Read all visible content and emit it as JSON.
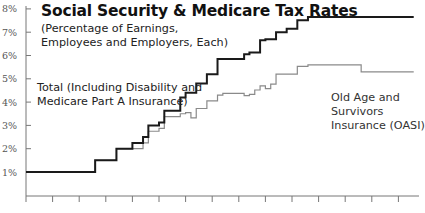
{
  "chart_data": {
    "type": "line",
    "step": true,
    "title": "Social Security & Medicare Tax Rates",
    "subtitle": [
      "(Percentage of Earnings,",
      "Employees and Employers, Each)"
    ],
    "xlabel": "",
    "ylabel": "",
    "ylim": [
      0,
      8
    ],
    "y_ticks": [
      "1%",
      "2%",
      "3%",
      "4%",
      "5%",
      "6%",
      "7%",
      "8%"
    ],
    "x_ticks_count": 15,
    "x_tick_labels": [],
    "grid": false,
    "annotations": {
      "total": [
        "Total (Including Disability and",
        "Medicare Part A Insurance)"
      ],
      "oasi": [
        "Old Age and",
        "Survivors",
        "Insurance (OASI)"
      ]
    },
    "series": [
      {
        "name": "Total (Including Disability and Medicare Part A Insurance)",
        "color": "#1a1a1a",
        "width": 2,
        "points": [
          [
            1937,
            1.0
          ],
          [
            1950,
            1.5
          ],
          [
            1954,
            2.0
          ],
          [
            1957,
            2.25
          ],
          [
            1959,
            2.5
          ],
          [
            1960,
            3.0
          ],
          [
            1962,
            3.125
          ],
          [
            1963,
            3.625
          ],
          [
            1966,
            4.2
          ],
          [
            1967,
            4.4
          ],
          [
            1969,
            4.8
          ],
          [
            1971,
            5.2
          ],
          [
            1973,
            5.85
          ],
          [
            1978,
            6.05
          ],
          [
            1979,
            6.13
          ],
          [
            1981,
            6.65
          ],
          [
            1982,
            6.7
          ],
          [
            1984,
            7.0
          ],
          [
            1986,
            7.15
          ],
          [
            1988,
            7.51
          ],
          [
            1990,
            7.65
          ],
          [
            2008,
            7.65
          ]
        ]
      },
      {
        "name": "Old Age and Survivors Insurance (OASI)",
        "color": "#8a8a8a",
        "width": 1.2,
        "points": [
          [
            1937,
            1.0
          ],
          [
            1950,
            1.5
          ],
          [
            1954,
            2.0
          ],
          [
            1957,
            2.0
          ],
          [
            1959,
            2.25
          ],
          [
            1960,
            2.75
          ],
          [
            1962,
            2.875
          ],
          [
            1963,
            3.375
          ],
          [
            1966,
            3.5
          ],
          [
            1967,
            3.55
          ],
          [
            1968,
            3.325
          ],
          [
            1969,
            3.725
          ],
          [
            1971,
            4.05
          ],
          [
            1973,
            4.3
          ],
          [
            1974,
            4.375
          ],
          [
            1978,
            4.275
          ],
          [
            1979,
            4.33
          ],
          [
            1980,
            4.52
          ],
          [
            1981,
            4.7
          ],
          [
            1982,
            4.575
          ],
          [
            1983,
            4.775
          ],
          [
            1984,
            5.2
          ],
          [
            1988,
            5.53
          ],
          [
            1990,
            5.6
          ],
          [
            2000,
            5.3
          ],
          [
            2005,
            5.3
          ],
          [
            2008,
            5.3
          ]
        ]
      }
    ]
  }
}
